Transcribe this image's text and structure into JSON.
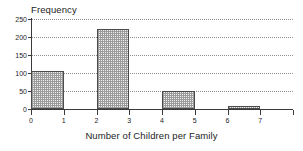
{
  "chart_data": {
    "type": "bar",
    "title": "",
    "ylabel": "Frequency",
    "xlabel": "Number of Children per Family",
    "categories": [
      "0 - 1",
      "2 - 3",
      "4 - 5",
      "6 - 7"
    ],
    "bin_edges": [
      0,
      1,
      2,
      3,
      4,
      5,
      6,
      7
    ],
    "values": [
      105,
      222,
      50,
      8
    ],
    "ylim": [
      0,
      250
    ],
    "xlim": [
      0,
      8
    ],
    "ytick_labels": [
      "0",
      "50",
      "100",
      "150",
      "200",
      "250"
    ],
    "ytick_values": [
      0,
      50,
      100,
      150,
      200,
      250
    ],
    "xtick_labels": [
      "0",
      "1",
      "2",
      "3",
      "4",
      "5",
      "6",
      "7"
    ],
    "xtick_values": [
      0,
      1,
      2,
      3,
      4,
      5,
      6,
      7
    ],
    "grid": true,
    "grid_axis": "y",
    "legend": null,
    "bar_fill": "#f2f2f2",
    "bar_pattern": "dotted-stipple",
    "bar_edge_color": "#4a4a4a",
    "axis_color": "#3a3a3a",
    "grid_color": "#8f8f8f"
  },
  "artifact": {
    "top_text": ""
  }
}
